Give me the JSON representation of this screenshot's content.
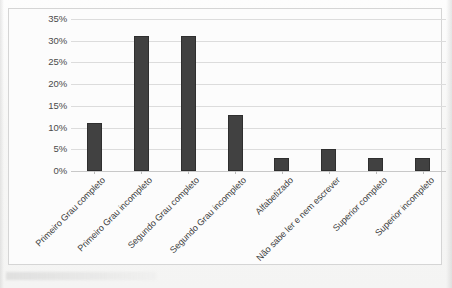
{
  "chart_data": {
    "type": "bar",
    "title": "",
    "xlabel": "",
    "ylabel": "",
    "categories": [
      "Primeiro Grau completo",
      "Primeiro Grau incompleto",
      "Segundo Grau completo",
      "Segundo Grau incompleto",
      "Alfabetizado",
      "Não sabe ler e nem escrever",
      "Superior completo",
      "Superior incompleto"
    ],
    "values": [
      11,
      31,
      31,
      13,
      3,
      5,
      3,
      3
    ],
    "value_labels": [
      "11%",
      "31%",
      "31%",
      "13%",
      "3%",
      "5%",
      "3%",
      "3%"
    ],
    "ylim": [
      0,
      35
    ],
    "ytick_labels": [
      "0%",
      "5%",
      "10%",
      "15%",
      "20%",
      "25%",
      "30%",
      "35%"
    ],
    "ytick_values": [
      0,
      5,
      10,
      15,
      20,
      25,
      30,
      35
    ],
    "grid": true,
    "legend": false,
    "legend_position": "none",
    "bar_color": "#414141",
    "bar_border_color": "#2f2f2f",
    "gridline_color": "#dcdcdc",
    "axis_color": "#c8c8c8",
    "plot_background": "#fcfcfc",
    "frame_border_color": "#d5d5d5",
    "tick_label_color": "#4a4a4a",
    "category_label_color": "#3c3c3c",
    "category_label_rotation": -45
  }
}
